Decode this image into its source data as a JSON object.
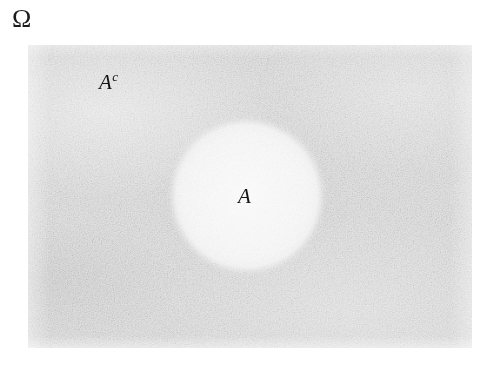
{
  "figure": {
    "type": "venn-diagram",
    "sample_space_label": "Ω",
    "region_labels": {
      "complement": "A",
      "complement_superscript": "c",
      "set": "A"
    },
    "colors": {
      "page_background": "#ffffff",
      "universe_fill": "#e7e7e7",
      "set_fill": "#f8f8f8",
      "text": "#141414"
    },
    "geometry": {
      "rect_x": 28,
      "rect_y": 45,
      "rect_width": 444,
      "rect_height": 303,
      "circle_center_x": 247,
      "circle_center_y": 196,
      "circle_radius": 70
    }
  }
}
